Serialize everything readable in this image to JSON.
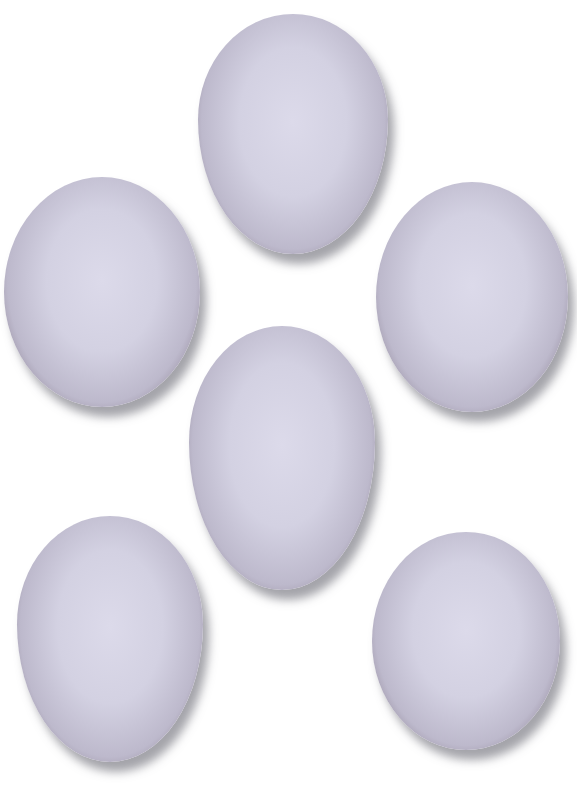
{
  "scene": {
    "description": "Six white eggs arranged on a white background",
    "background_color": "#ffffff",
    "egg_color": "#d8d6e6",
    "egg_rim_color": "#5a4a58",
    "eggs": [
      {
        "id": "top-center",
        "x": 198,
        "y": 14,
        "w": 190,
        "h": 240
      },
      {
        "id": "upper-left",
        "x": 4,
        "y": 177,
        "w": 196,
        "h": 230
      },
      {
        "id": "upper-right",
        "x": 376,
        "y": 182,
        "w": 192,
        "h": 230
      },
      {
        "id": "center",
        "x": 189,
        "y": 326,
        "w": 186,
        "h": 264
      },
      {
        "id": "lower-left",
        "x": 17,
        "y": 516,
        "w": 186,
        "h": 246
      },
      {
        "id": "lower-right",
        "x": 372,
        "y": 532,
        "w": 188,
        "h": 218
      }
    ]
  }
}
